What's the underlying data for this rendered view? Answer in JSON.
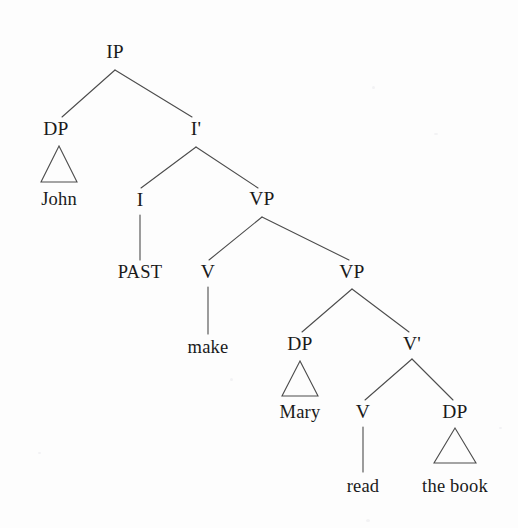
{
  "diagram": {
    "type": "x-bar-constituency-tree",
    "sentence": "John PAST make Mary read the book",
    "line_color": "#4c4c4c",
    "text_color": "#1a1a1a",
    "background": "#fdfdfd"
  },
  "nodes": [
    {
      "id": "ip",
      "label": "IP",
      "kind": "category",
      "x": 115,
      "y": 52
    },
    {
      "id": "dp1",
      "label": "DP",
      "kind": "category",
      "x": 56,
      "y": 129
    },
    {
      "id": "ibar",
      "label": "I'",
      "kind": "category",
      "x": 196,
      "y": 129
    },
    {
      "id": "john",
      "label": "John",
      "kind": "terminal",
      "x": 59,
      "y": 199
    },
    {
      "id": "i",
      "label": "I",
      "kind": "category",
      "x": 140,
      "y": 200
    },
    {
      "id": "vp1",
      "label": "VP",
      "kind": "category",
      "x": 262,
      "y": 199
    },
    {
      "id": "past",
      "label": "PAST",
      "kind": "terminal",
      "x": 140,
      "y": 272
    },
    {
      "id": "v1",
      "label": "V",
      "kind": "category",
      "x": 208,
      "y": 272
    },
    {
      "id": "vp2",
      "label": "VP",
      "kind": "category",
      "x": 352,
      "y": 272
    },
    {
      "id": "make",
      "label": "make",
      "kind": "terminal",
      "x": 208,
      "y": 347
    },
    {
      "id": "dp2",
      "label": "DP",
      "kind": "category",
      "x": 300,
      "y": 344
    },
    {
      "id": "vbar",
      "label": "V'",
      "kind": "category",
      "x": 412,
      "y": 344
    },
    {
      "id": "mary",
      "label": "Mary",
      "kind": "terminal",
      "x": 300,
      "y": 412
    },
    {
      "id": "v2",
      "label": "V",
      "kind": "category",
      "x": 363,
      "y": 412
    },
    {
      "id": "dp3",
      "label": "DP",
      "kind": "category",
      "x": 455,
      "y": 412
    },
    {
      "id": "read",
      "label": "read",
      "kind": "terminal",
      "x": 363,
      "y": 486
    },
    {
      "id": "thebook",
      "label": "the book",
      "kind": "terminal",
      "x": 455,
      "y": 486
    }
  ],
  "edges": [
    {
      "from": "ip",
      "to": "dp1",
      "x1": 115,
      "y1": 70,
      "x2": 62,
      "y2": 117
    },
    {
      "from": "ip",
      "to": "ibar",
      "x1": 115,
      "y1": 70,
      "x2": 192,
      "y2": 117
    },
    {
      "from": "ibar",
      "to": "i",
      "x1": 196,
      "y1": 147,
      "x2": 141,
      "y2": 188
    },
    {
      "from": "ibar",
      "to": "vp1",
      "x1": 196,
      "y1": 147,
      "x2": 258,
      "y2": 188
    },
    {
      "from": "i",
      "to": "past",
      "x1": 140,
      "y1": 215,
      "x2": 140,
      "y2": 260
    },
    {
      "from": "vp1",
      "to": "v1",
      "x1": 262,
      "y1": 217,
      "x2": 209,
      "y2": 260
    },
    {
      "from": "vp1",
      "to": "vp2",
      "x1": 262,
      "y1": 217,
      "x2": 349,
      "y2": 260
    },
    {
      "from": "v1",
      "to": "make",
      "x1": 208,
      "y1": 287,
      "x2": 208,
      "y2": 334
    },
    {
      "from": "vp2",
      "to": "dp2",
      "x1": 352,
      "y1": 289,
      "x2": 302,
      "y2": 332
    },
    {
      "from": "vp2",
      "to": "vbar",
      "x1": 352,
      "y1": 289,
      "x2": 409,
      "y2": 332
    },
    {
      "from": "vbar",
      "to": "v2",
      "x1": 412,
      "y1": 359,
      "x2": 365,
      "y2": 400
    },
    {
      "from": "vbar",
      "to": "dp3",
      "x1": 412,
      "y1": 359,
      "x2": 453,
      "y2": 400
    },
    {
      "from": "v2",
      "to": "read",
      "x1": 363,
      "y1": 427,
      "x2": 363,
      "y2": 472
    }
  ],
  "triangles": [
    {
      "id": "tri-john",
      "for": "dp1",
      "apex_x": 59,
      "apex_y": 146,
      "left_x": 41,
      "right_x": 77,
      "base_y": 182
    },
    {
      "id": "tri-mary",
      "for": "dp2",
      "apex_x": 300,
      "apex_y": 361,
      "left_x": 282,
      "right_x": 318,
      "base_y": 396
    },
    {
      "id": "tri-thebook",
      "for": "dp3",
      "apex_x": 455,
      "apex_y": 428,
      "left_x": 434,
      "right_x": 476,
      "base_y": 463
    }
  ]
}
